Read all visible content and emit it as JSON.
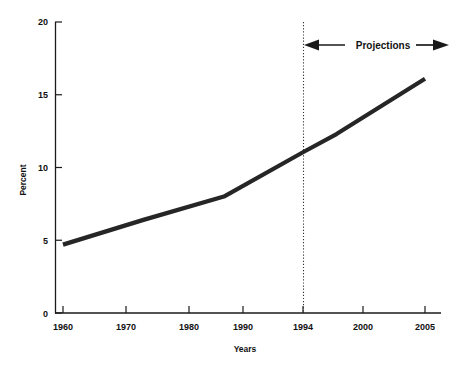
{
  "chart_data": {
    "type": "line",
    "title": "",
    "xlabel": "Years",
    "ylabel": "Percent",
    "x": [
      1960,
      1970,
      1980,
      1990,
      1994,
      2005
    ],
    "values": [
      4.7,
      6.4,
      8.0,
      11.1,
      12.3,
      16.1
    ],
    "series": [
      {
        "name": "Percent",
        "values": [
          4.7,
          6.4,
          8.0,
          11.1,
          12.3,
          16.1
        ]
      }
    ],
    "xlim": [
      1957,
      2008
    ],
    "ylim": [
      0,
      20
    ],
    "x_ticks": [
      1960,
      1970,
      1980,
      1990,
      1994,
      2000,
      2005
    ],
    "x_tick_labels": [
      "1960",
      "1970",
      "1980",
      "1990",
      "1994",
      "2000",
      "2005"
    ],
    "y_ticks": [
      0,
      5,
      10,
      15,
      20
    ],
    "y_tick_labels": [
      "0",
      "5",
      "10",
      "15",
      "20"
    ],
    "grid": false,
    "legend": "none",
    "annotations": [
      {
        "name": "projections-divider",
        "type": "vline",
        "x": 1994,
        "style": "dotted"
      },
      {
        "name": "projections-span",
        "type": "double-arrow",
        "label": "Projections",
        "x_start": 1994,
        "x_end": 2008,
        "y": 18.7
      }
    ],
    "line_color": "#262626",
    "axis_color": "#1a1a1a"
  },
  "axes": {
    "y_title": "Percent",
    "x_title": "Years"
  },
  "annotation": {
    "projections_label": "Projections"
  },
  "ticks": {
    "y": [
      "20",
      "15",
      "10",
      "5",
      "0"
    ],
    "x": [
      "1960",
      "1970",
      "1980",
      "1990",
      "1994",
      "2000",
      "2005"
    ]
  }
}
